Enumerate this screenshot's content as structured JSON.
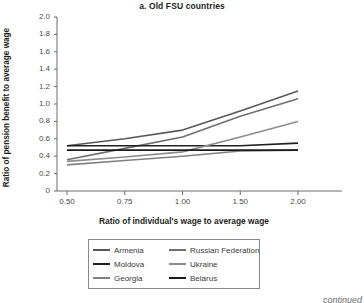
{
  "figure": {
    "title": "a. Old FSU countries",
    "footnote": "continued"
  },
  "axes": {
    "ylabel": "Ratio of pension benefit to average wage",
    "xlabel": "Ratio of individual's wage to average wage",
    "yticks": [
      "2.0",
      "1.8",
      "1.6",
      "1.4",
      "1.2",
      "1.0",
      "0.8",
      "0.6",
      "0.4",
      "0.2",
      "0"
    ],
    "xticks": [
      "0.50",
      "0.75",
      "1.00",
      "1.50",
      "2.00"
    ]
  },
  "legend": {
    "items": [
      {
        "label": "Armenia",
        "color": "#58585a"
      },
      {
        "label": "Russian Federation",
        "color": "#6d6e70"
      },
      {
        "label": "Moldova",
        "color": "#231f20"
      },
      {
        "label": "Ukraine",
        "color": "#8c8c8e"
      },
      {
        "label": "Georgia",
        "color": "#808184"
      },
      {
        "label": "Belarus",
        "color": "#1a1a1a"
      }
    ]
  },
  "chart_data": {
    "type": "line",
    "title": "a. Old FSU countries",
    "xlabel": "Ratio of individual's wage to average wage",
    "ylabel": "Ratio of pension benefit to average wage",
    "categories": [
      "0.50",
      "0.75",
      "1.00",
      "1.50",
      "2.00"
    ],
    "x": [
      0.5,
      0.75,
      1.0,
      1.5,
      2.0
    ],
    "ylim": [
      0,
      2.0
    ],
    "ytick_step": 0.2,
    "grid": false,
    "legend_position": "below",
    "series": [
      {
        "name": "Armenia",
        "color": "#58585a",
        "values": [
          0.52,
          0.6,
          0.7,
          0.92,
          1.15
        ]
      },
      {
        "name": "Russian Federation",
        "color": "#6d6e70",
        "values": [
          0.36,
          0.49,
          0.62,
          0.86,
          1.06
        ]
      },
      {
        "name": "Moldova",
        "color": "#231f20",
        "values": [
          0.52,
          0.52,
          0.52,
          0.52,
          0.55
        ]
      },
      {
        "name": "Ukraine",
        "color": "#8c8c8e",
        "values": [
          0.34,
          0.39,
          0.45,
          0.62,
          0.8
        ]
      },
      {
        "name": "Georgia",
        "color": "#808184",
        "values": [
          0.3,
          0.35,
          0.4,
          0.46,
          0.47
        ]
      },
      {
        "name": "Belarus",
        "color": "#1a1a1a",
        "values": [
          0.47,
          0.47,
          0.47,
          0.47,
          0.47
        ]
      }
    ]
  },
  "plot_geometry": {
    "left": 57,
    "right": 308,
    "top": 17,
    "bottom": 191,
    "axis_color": "#6b6b6b"
  }
}
